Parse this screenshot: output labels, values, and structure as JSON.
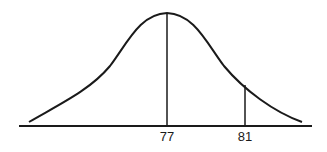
{
  "diagram": {
    "type": "normal-distribution-curve",
    "colors": {
      "line": "#1a1a1a",
      "background": "#ffffff"
    },
    "curve": {
      "mean_label": "77",
      "peak": {
        "x": 167,
        "y": 13
      }
    },
    "axis": {
      "x1": 19,
      "x2": 312,
      "y": 126
    },
    "markers": [
      {
        "label": "77",
        "x": 167,
        "top_y": 13
      },
      {
        "label": "81",
        "x": 245,
        "top_y": 85
      }
    ]
  }
}
